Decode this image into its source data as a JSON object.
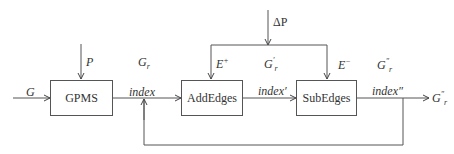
{
  "diagram": {
    "blocks": [
      {
        "id": "gpms",
        "label": "GPMS"
      },
      {
        "id": "addedges",
        "label": "AddEdges"
      },
      {
        "id": "subedges",
        "label": "SubEdges"
      }
    ],
    "labels": {
      "input_g": "G",
      "input_p": "P",
      "delta_p": "ΔP",
      "gr": "G",
      "gr_sub": "r",
      "gr_prime": "G",
      "gr_prime_sub": "r",
      "gr_prime_sup": "′",
      "gr_dprime": "G",
      "gr_dprime_sub": "r",
      "gr_dprime_sup": "″",
      "e_plus": "E",
      "e_plus_sup": "+",
      "e_minus": "E",
      "e_minus_sup": "−",
      "index": "index",
      "index_prime": "index′",
      "index_dprime": "index″",
      "output": "G",
      "output_sub": "r",
      "output_sup": "″"
    },
    "edges": [
      {
        "from": "G",
        "to": "gpms"
      },
      {
        "from": "P",
        "to": "gpms"
      },
      {
        "from": "gpms",
        "to": "addedges",
        "label": "index"
      },
      {
        "from": "ΔP",
        "to": "addedges",
        "label": "E+"
      },
      {
        "from": "ΔP",
        "to": "subedges",
        "label": "E−"
      },
      {
        "from": "addedges",
        "to": "subedges",
        "label": "index′"
      },
      {
        "from": "subedges",
        "to": "output",
        "label": "index″"
      },
      {
        "from": "subedges",
        "to": "index-junction",
        "label": "feedback"
      }
    ]
  }
}
